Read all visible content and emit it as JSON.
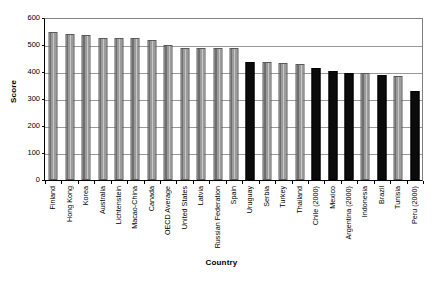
{
  "chart_data": {
    "type": "bar",
    "title": "",
    "xlabel": "Country",
    "ylabel": "Score",
    "ylim": [
      0,
      600
    ],
    "yticks": [
      0,
      100,
      200,
      300,
      400,
      500,
      600
    ],
    "grid": true,
    "legend": "none",
    "categories": [
      "Finland",
      "Hong Kong",
      "Korea",
      "Australia",
      "Lichtenstein",
      "Macao-China",
      "Canada",
      "OECD Average",
      "United States",
      "Latvia",
      "Russian Federation",
      "Spain",
      "Uruguay",
      "Serbia",
      "Turkey",
      "Thailand",
      "Chile (2000)",
      "Mexico",
      "Argentina (2000)",
      "Indonesia",
      "Brazil",
      "Tunisia",
      "Peru (2000)"
    ],
    "values": [
      548,
      540,
      538,
      525,
      525,
      525,
      518,
      500,
      490,
      490,
      490,
      488,
      438,
      437,
      434,
      430,
      414,
      405,
      396,
      395,
      390,
      385,
      330
    ],
    "bar_colors": [
      "gray",
      "gray",
      "gray",
      "gray",
      "gray",
      "gray",
      "gray",
      "gray",
      "gray",
      "gray",
      "gray",
      "gray",
      "black",
      "gray",
      "gray",
      "gray",
      "black",
      "black",
      "black",
      "gray",
      "black",
      "gray",
      "black"
    ],
    "color_legend": {
      "gray": "#8c8c8c",
      "black": "#0b0b0b"
    }
  }
}
